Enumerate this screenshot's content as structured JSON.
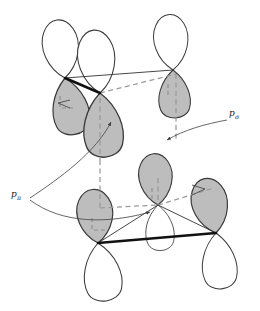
{
  "figure": {
    "name": "p-orbital-overlap-diagram",
    "background": "#ffffff",
    "width": 260,
    "height": 311,
    "colors": {
      "lobe_outline": "#3a3a3a",
      "lobe_shaded_fill": "#bdbdbd",
      "lobe_empty_fill": "#ffffff",
      "bond_bold": "#111111",
      "bond_thin": "#333333",
      "lattice_dashed": "#9a9a9a",
      "leader_line": "#4a4a4a",
      "label_text": "#1a1a1a"
    }
  },
  "labels": [
    {
      "id": "p-sigma",
      "base": "p",
      "subscript": "σ",
      "text": "pσ",
      "x": 232,
      "y": 116,
      "leader": "curved-arrow-to-lower-right-dashed-node"
    },
    {
      "id": "p-pi",
      "base": "p",
      "subscript": "π",
      "text": "pπ",
      "x": 14,
      "y": 197,
      "leader": "two-curved-arrows-to-upper-and-lower-cluster"
    }
  ],
  "clusters": [
    {
      "id": "upper-cluster",
      "description": "three p-orbital pairs with shaded lower lobes and empty upper lobes",
      "orbital_count": 3,
      "vertices": [
        {
          "id": "u-left",
          "x": 65,
          "y": 78
        },
        {
          "id": "u-center",
          "x": 100,
          "y": 93
        },
        {
          "id": "u-right",
          "x": 173,
          "y": 70
        }
      ],
      "bold_bonds": [
        [
          "u-left",
          "u-center"
        ]
      ],
      "thin_bonds": [
        [
          "u-left",
          "u-right"
        ]
      ],
      "dashed_edges": [
        [
          "u-center",
          "u-right"
        ]
      ]
    },
    {
      "id": "lower-cluster",
      "description": "three p-orbital pairs with shaded upper lobes and empty lower lobes",
      "orbital_count": 3,
      "vertices": [
        {
          "id": "l-left",
          "x": 98,
          "y": 243
        },
        {
          "id": "l-center",
          "x": 158,
          "y": 205
        },
        {
          "id": "l-right",
          "x": 216,
          "y": 233
        }
      ],
      "bold_bonds": [
        [
          "l-left",
          "l-right"
        ]
      ],
      "thin_bonds": [
        [
          "l-center",
          "l-left"
        ],
        [
          "l-center",
          "l-right"
        ]
      ],
      "dashed_edges": [
        [
          "l-center",
          "l-right-lobe"
        ]
      ]
    }
  ],
  "lattice": {
    "style": "dashed",
    "description": "gray dashed lines connecting upper cluster nodes down to lower cluster nodes forming a 3D cell"
  },
  "arrowheads": [
    {
      "id": "arrow-into-upper-left-lobe",
      "x": 84,
      "y": 103,
      "direction": "left"
    },
    {
      "id": "arrow-into-lower-right-lobe",
      "x": 200,
      "y": 190,
      "direction": "right"
    },
    {
      "id": "arrow-psigma-tip",
      "x": 164,
      "y": 140,
      "direction": "down-left"
    },
    {
      "id": "arrow-ppi-upper-tip",
      "x": 113,
      "y": 120,
      "direction": "up"
    },
    {
      "id": "arrow-ppi-lower-tip",
      "x": 153,
      "y": 213,
      "direction": "right"
    }
  ]
}
